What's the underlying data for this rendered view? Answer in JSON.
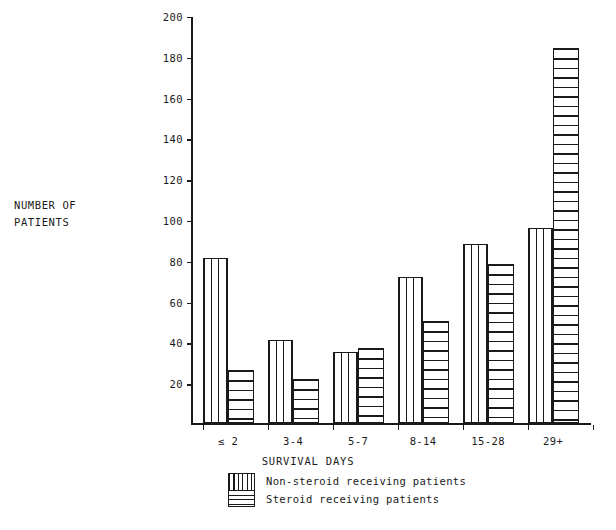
{
  "chart_data": {
    "type": "bar",
    "title": "",
    "xlabel": "SURVIVAL DAYS",
    "ylabel": "NUMBER OF\nPATIENTS",
    "categories": [
      "≤ 2",
      "3-4",
      "5-7",
      "8-14",
      "15-28",
      "29+"
    ],
    "series": [
      {
        "name": "Non-steroid receiving patients",
        "pattern": "vertical-stripes",
        "values": [
          81,
          41,
          35,
          72,
          88,
          96
        ]
      },
      {
        "name": "Steroid receiving patients",
        "pattern": "horizontal-stripes",
        "values": [
          26,
          22,
          37,
          50,
          78,
          184
        ]
      }
    ],
    "ylim": [
      0,
      200
    ],
    "ytick_labels": [
      "200",
      "180",
      "160",
      "140",
      "120",
      "100",
      "80",
      "60",
      "40",
      "20"
    ],
    "ytick_values": [
      200,
      180,
      160,
      140,
      120,
      100,
      80,
      60,
      40,
      20
    ],
    "grid": false,
    "legend_position": "below-axis-center",
    "colors": {
      "ink": "#1a1a1a",
      "background": "#ffffff"
    }
  },
  "axis": {
    "y_title_line1": "NUMBER OF",
    "y_title_line2": "PATIENTS",
    "x_title": "SURVIVAL DAYS"
  },
  "legend": {
    "items": [
      {
        "label": "Non-steroid receiving patients"
      },
      {
        "label": "Steroid receiving patients"
      }
    ]
  }
}
